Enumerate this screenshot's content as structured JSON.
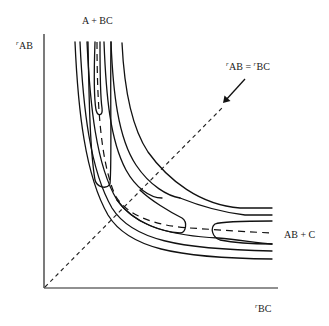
{
  "diagram": {
    "type": "potential-energy-surface-contour",
    "labels": {
      "reactants": "A + BC",
      "products": "AB + C",
      "y_axis_prefix": "r",
      "y_axis": "AB",
      "x_axis_prefix": "r",
      "x_axis": "BC",
      "symmetry_line_r1": "r",
      "symmetry_line_ab": "AB",
      "symmetry_line_eq": " = ",
      "symmetry_line_r2": "r",
      "symmetry_line_bc": "BC"
    },
    "elements": {
      "y_axis": "r_AB axis",
      "x_axis": "r_BC axis",
      "contour_lines": 10,
      "minimum_energy_path": "dashed curve from A + BC valley to AB + C valley",
      "symmetry_line": "dashed diagonal r_AB = r_BC",
      "arrow": "points to symmetry line"
    },
    "colors": {
      "ink": "#111111",
      "background": "#ffffff"
    }
  }
}
